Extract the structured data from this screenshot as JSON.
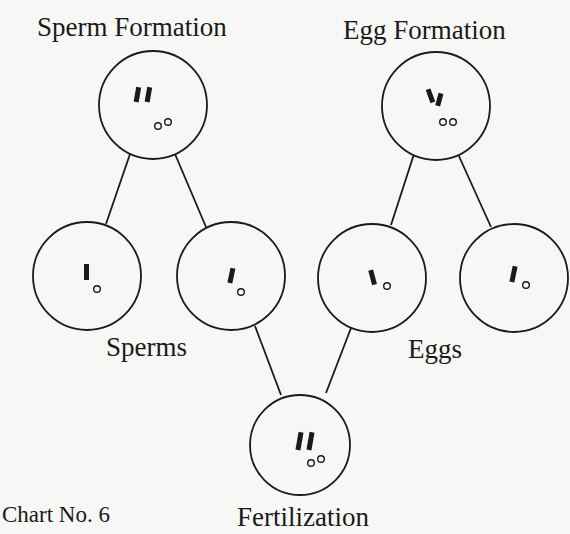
{
  "diagram": {
    "type": "tree",
    "caption": "Chart No. 6",
    "labels": {
      "sperm_formation": "Sperm Formation",
      "egg_formation": "Egg Formation",
      "sperms": "Sperms",
      "eggs": "Eggs",
      "fertilization": "Fertilization"
    },
    "nodes": [
      {
        "id": "sperm-parent",
        "label": "Sperm Formation",
        "chromosomes": 2,
        "dots": 2
      },
      {
        "id": "egg-parent",
        "label": "Egg Formation",
        "chromosomes": 2,
        "dots": 2
      },
      {
        "id": "sperm-1",
        "label": "Sperms",
        "chromosomes": 1,
        "dots": 1
      },
      {
        "id": "sperm-2",
        "label": "Sperms",
        "chromosomes": 1,
        "dots": 1
      },
      {
        "id": "egg-1",
        "label": "Eggs",
        "chromosomes": 1,
        "dots": 1
      },
      {
        "id": "egg-2",
        "label": "Eggs",
        "chromosomes": 1,
        "dots": 1
      },
      {
        "id": "zygote",
        "label": "Fertilization",
        "chromosomes": 2,
        "dots": 2
      }
    ],
    "edges": [
      [
        "sperm-parent",
        "sperm-1"
      ],
      [
        "sperm-parent",
        "sperm-2"
      ],
      [
        "egg-parent",
        "egg-1"
      ],
      [
        "egg-parent",
        "egg-2"
      ],
      [
        "sperm-2",
        "zygote"
      ],
      [
        "egg-1",
        "zygote"
      ]
    ]
  }
}
